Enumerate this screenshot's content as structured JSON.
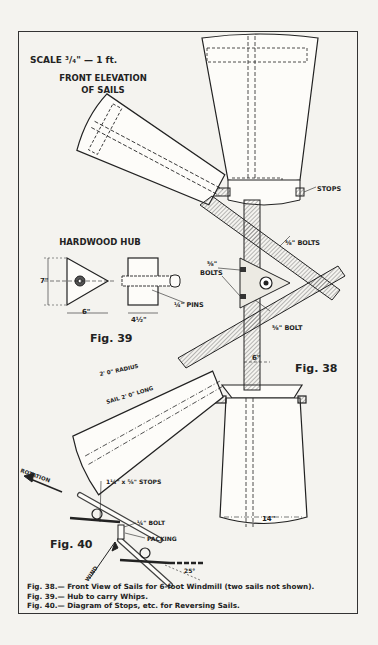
{
  "header": {
    "scale": "SCALE ³/₄\" — 1 ft.",
    "title_line1": "FRONT ELEVATION",
    "title_line2": "OF SAILS"
  },
  "fig39": {
    "title": "HARDWOOD HUB",
    "dim_height": "7\"",
    "dim_width": "6\"",
    "dim_depth": "4½\"",
    "pins": "¼\" PINS",
    "label": "Fig. 39"
  },
  "fig38": {
    "stops": "STOPS",
    "bolts_top": "⅝\" BOLTS",
    "bolts_left_1": "⅝\"",
    "bolts_left_2": "BOLTS",
    "bolt_lower": "⅝\" BOLT",
    "hub_width": "6\"",
    "radius": "2' 0\" RADIUS",
    "sail_length": "SAIL 2' 0\" LONG",
    "tip_width": "14\"",
    "label": "Fig. 38"
  },
  "fig40": {
    "rotation": "ROTATION",
    "stops": "1¼\" x ⅝\" STOPS",
    "bolt": "¼\" BOLT",
    "packing": "PACKING",
    "wind": "WIND",
    "angle": "25°",
    "label": "Fig. 40"
  },
  "caption": {
    "line1": "Fig. 38.— Front View of Sails for 6-foot Windmill (two sails not shown).",
    "line2": "Fig. 39.— Hub to carry Whips.",
    "line3": "Fig. 40.— Diagram of Stops, etc. for Reversing Sails."
  }
}
